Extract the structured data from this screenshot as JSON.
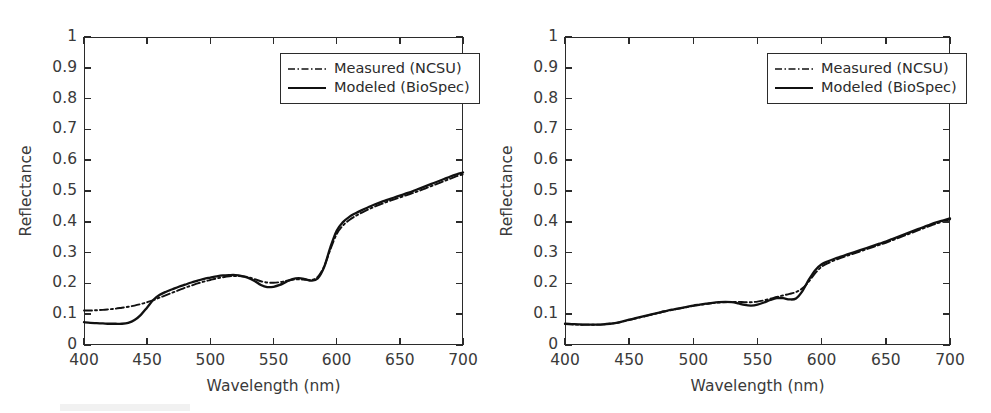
{
  "figure": {
    "background": "#ffffff",
    "axis_color": "#2b2b2b",
    "series_color": "#111111"
  },
  "panels": [
    {
      "id": "left",
      "name": "light-skin-panel",
      "axes": {
        "xlabel": "Wavelength (nm)",
        "ylabel": "Reflectance",
        "xlim": [
          400,
          700
        ],
        "ylim": [
          0,
          1
        ],
        "xticks": [
          400,
          450,
          500,
          550,
          600,
          650,
          700
        ],
        "xticklabels": [
          "400",
          "450",
          "500",
          "550",
          "600",
          "650",
          "700"
        ],
        "yticks": [
          0,
          0.1,
          0.2,
          0.3,
          0.4,
          0.5,
          0.6,
          0.7,
          0.8,
          0.9,
          1
        ],
        "yticklabels": [
          "0",
          "0.1",
          "0.2",
          "0.3",
          "0.4",
          "0.5",
          "0.6",
          "0.7",
          "0.8",
          "0.9",
          "1"
        ],
        "grid": false,
        "ticks_inward": true,
        "ticks_all_sides": true
      },
      "legend": {
        "position": "upper-center",
        "entries": [
          {
            "label": "Measured (NCSU)",
            "style": "dash-dot"
          },
          {
            "label": "Modeled (BioSpec)",
            "style": "solid"
          }
        ]
      }
    },
    {
      "id": "right",
      "name": "dark-skin-panel",
      "axes": {
        "xlabel": "Wavelength (nm)",
        "ylabel": "Reflectance",
        "xlim": [
          400,
          700
        ],
        "ylim": [
          0,
          1
        ],
        "xticks": [
          400,
          450,
          500,
          550,
          600,
          650,
          700
        ],
        "xticklabels": [
          "400",
          "450",
          "500",
          "550",
          "600",
          "650",
          "700"
        ],
        "yticks": [
          0,
          0.1,
          0.2,
          0.3,
          0.4,
          0.5,
          0.6,
          0.7,
          0.8,
          0.9,
          1
        ],
        "yticklabels": [
          "0",
          "0.1",
          "0.2",
          "0.3",
          "0.4",
          "0.5",
          "0.6",
          "0.7",
          "0.8",
          "0.9",
          "1"
        ],
        "grid": false,
        "ticks_inward": true,
        "ticks_all_sides": true
      },
      "legend": {
        "position": "upper-center",
        "entries": [
          {
            "label": "Measured (NCSU)",
            "style": "dash-dot"
          },
          {
            "label": "Modeled (BioSpec)",
            "style": "solid"
          }
        ]
      }
    }
  ],
  "chart_data": [
    {
      "type": "line",
      "panel": "left",
      "title": "",
      "xlabel": "Wavelength (nm)",
      "ylabel": "Reflectance",
      "xlim": [
        400,
        700
      ],
      "ylim": [
        0,
        1
      ],
      "grid": false,
      "legend_position": "upper-center",
      "x": [
        400,
        405,
        410,
        415,
        420,
        425,
        430,
        435,
        440,
        445,
        450,
        455,
        460,
        465,
        470,
        475,
        480,
        485,
        490,
        495,
        500,
        505,
        510,
        515,
        520,
        525,
        530,
        535,
        540,
        545,
        550,
        555,
        560,
        565,
        570,
        575,
        580,
        585,
        590,
        595,
        600,
        605,
        610,
        615,
        620,
        625,
        630,
        635,
        640,
        645,
        650,
        655,
        660,
        665,
        670,
        675,
        680,
        685,
        690,
        695,
        700
      ],
      "series": [
        {
          "name": "Measured (NCSU)",
          "style": "dash-dot",
          "values": [
            0.112,
            0.112,
            0.113,
            0.114,
            0.116,
            0.118,
            0.121,
            0.124,
            0.128,
            0.133,
            0.139,
            0.146,
            0.154,
            0.162,
            0.17,
            0.178,
            0.186,
            0.193,
            0.2,
            0.206,
            0.211,
            0.216,
            0.22,
            0.223,
            0.224,
            0.223,
            0.22,
            0.214,
            0.207,
            0.203,
            0.202,
            0.204,
            0.208,
            0.212,
            0.213,
            0.212,
            0.211,
            0.221,
            0.254,
            0.31,
            0.36,
            0.388,
            0.406,
            0.419,
            0.43,
            0.44,
            0.449,
            0.457,
            0.465,
            0.472,
            0.479,
            0.486,
            0.493,
            0.5,
            0.508,
            0.516,
            0.524,
            0.532,
            0.54,
            0.548,
            0.554
          ]
        },
        {
          "name": "Modeled (BioSpec)",
          "style": "solid",
          "values": [
            0.074,
            0.072,
            0.071,
            0.07,
            0.069,
            0.069,
            0.069,
            0.072,
            0.081,
            0.098,
            0.122,
            0.147,
            0.163,
            0.173,
            0.181,
            0.189,
            0.196,
            0.203,
            0.209,
            0.215,
            0.219,
            0.223,
            0.226,
            0.227,
            0.227,
            0.224,
            0.218,
            0.208,
            0.195,
            0.188,
            0.189,
            0.195,
            0.205,
            0.214,
            0.217,
            0.214,
            0.209,
            0.216,
            0.252,
            0.317,
            0.371,
            0.399,
            0.416,
            0.428,
            0.438,
            0.447,
            0.456,
            0.464,
            0.471,
            0.478,
            0.485,
            0.492,
            0.499,
            0.507,
            0.515,
            0.523,
            0.531,
            0.539,
            0.547,
            0.554,
            0.56
          ]
        }
      ]
    },
    {
      "type": "line",
      "panel": "right",
      "title": "",
      "xlabel": "Wavelength (nm)",
      "ylabel": "Reflectance",
      "xlim": [
        400,
        700
      ],
      "ylim": [
        0,
        1
      ],
      "grid": false,
      "legend_position": "upper-center",
      "x": [
        400,
        405,
        410,
        415,
        420,
        425,
        430,
        435,
        440,
        445,
        450,
        455,
        460,
        465,
        470,
        475,
        480,
        485,
        490,
        495,
        500,
        505,
        510,
        515,
        520,
        525,
        530,
        535,
        540,
        545,
        550,
        555,
        560,
        565,
        570,
        575,
        580,
        585,
        590,
        595,
        600,
        605,
        610,
        615,
        620,
        625,
        630,
        635,
        640,
        645,
        650,
        655,
        660,
        665,
        670,
        675,
        680,
        685,
        690,
        695,
        700
      ],
      "series": [
        {
          "name": "Measured (NCSU)",
          "style": "dash-dot",
          "values": [
            0.068,
            0.067,
            0.066,
            0.066,
            0.066,
            0.066,
            0.067,
            0.069,
            0.072,
            0.076,
            0.081,
            0.086,
            0.091,
            0.096,
            0.101,
            0.106,
            0.111,
            0.115,
            0.119,
            0.123,
            0.127,
            0.13,
            0.133,
            0.136,
            0.138,
            0.139,
            0.14,
            0.14,
            0.139,
            0.139,
            0.141,
            0.145,
            0.15,
            0.156,
            0.161,
            0.166,
            0.172,
            0.184,
            0.206,
            0.233,
            0.254,
            0.266,
            0.275,
            0.283,
            0.29,
            0.297,
            0.304,
            0.311,
            0.318,
            0.325,
            0.332,
            0.34,
            0.348,
            0.356,
            0.364,
            0.372,
            0.38,
            0.388,
            0.395,
            0.402,
            0.408
          ]
        },
        {
          "name": "Modeled (BioSpec)",
          "style": "solid",
          "values": [
            0.069,
            0.068,
            0.067,
            0.066,
            0.066,
            0.066,
            0.067,
            0.069,
            0.072,
            0.077,
            0.082,
            0.087,
            0.092,
            0.097,
            0.102,
            0.107,
            0.112,
            0.116,
            0.12,
            0.124,
            0.128,
            0.131,
            0.134,
            0.137,
            0.139,
            0.14,
            0.139,
            0.135,
            0.13,
            0.128,
            0.131,
            0.138,
            0.146,
            0.152,
            0.152,
            0.148,
            0.151,
            0.175,
            0.212,
            0.243,
            0.262,
            0.272,
            0.28,
            0.287,
            0.294,
            0.301,
            0.308,
            0.315,
            0.322,
            0.329,
            0.336,
            0.344,
            0.352,
            0.36,
            0.368,
            0.376,
            0.384,
            0.392,
            0.399,
            0.405,
            0.411
          ]
        }
      ]
    }
  ]
}
